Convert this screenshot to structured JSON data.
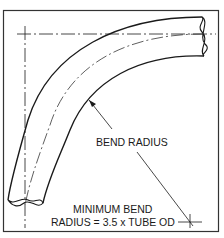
{
  "diagram": {
    "labels": {
      "bend_radius": "BEND RADIUS",
      "min_bend_line1": "MINIMUM BEND",
      "min_bend_line2": "RADIUS = 3.5 x TUBE OD"
    },
    "colors": {
      "line": "#1a1a1a",
      "frame": "#333333",
      "background": "#ffffff"
    }
  }
}
